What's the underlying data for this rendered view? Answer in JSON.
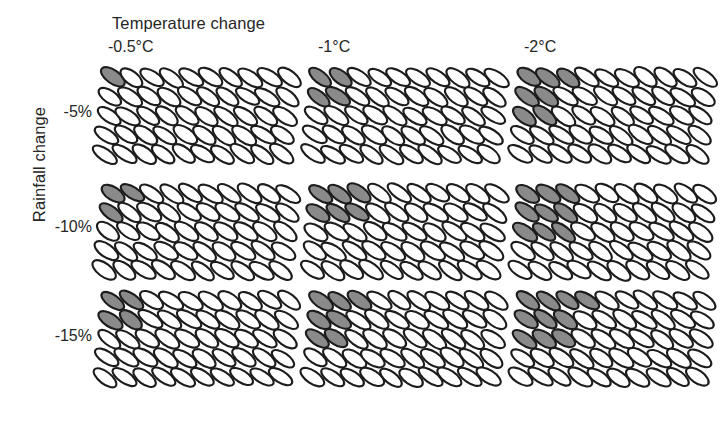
{
  "figure": {
    "x_axis_title": "Temperature change",
    "y_axis_title": "Rainfall change",
    "column_headers": [
      "-0.5°C",
      "-1°C",
      "-2°C"
    ],
    "row_labels": [
      "-5%",
      "-10%",
      "-15%"
    ]
  },
  "glyph": {
    "shape": "ellipse",
    "grid_columns": 10,
    "grid_rows": 5,
    "total_per_panel": 50,
    "tilt_degrees": -55,
    "filled_color": "#8a8a8a",
    "empty_color": "#ffffff",
    "outline_color": "#1c1c1c"
  },
  "chart_data": {
    "type": "heatmap",
    "title": "",
    "subtitle": "",
    "xlabel": "Temperature change",
    "ylabel": "Rainfall change",
    "x": [
      "-0.5°C",
      "-1°C",
      "-2°C"
    ],
    "y": [
      "-5%",
      "-10%",
      "-15%"
    ],
    "units": "count of shaded ellipses out of 50",
    "grid": false,
    "legend": "none",
    "annotations": [],
    "cells": [
      {
        "row": "-5%",
        "col": "-0.5°C",
        "filled": 1,
        "total": 50,
        "fill_pattern": [
          1,
          0,
          0,
          0,
          0
        ]
      },
      {
        "row": "-5%",
        "col": "-1°C",
        "filled": 4,
        "total": 50,
        "fill_pattern": [
          2,
          2,
          0,
          0,
          0
        ]
      },
      {
        "row": "-5%",
        "col": "-2°C",
        "filled": 7,
        "total": 50,
        "fill_pattern": [
          3,
          2,
          2,
          0,
          0
        ]
      },
      {
        "row": "-10%",
        "col": "-0.5°C",
        "filled": 3,
        "total": 50,
        "fill_pattern": [
          2,
          1,
          0,
          0,
          0
        ]
      },
      {
        "row": "-10%",
        "col": "-1°C",
        "filled": 6,
        "total": 50,
        "fill_pattern": [
          3,
          3,
          0,
          0,
          0
        ]
      },
      {
        "row": "-10%",
        "col": "-2°C",
        "filled": 9,
        "total": 50,
        "fill_pattern": [
          3,
          3,
          3,
          0,
          0
        ]
      },
      {
        "row": "-15%",
        "col": "-0.5°C",
        "filled": 4,
        "total": 50,
        "fill_pattern": [
          2,
          2,
          0,
          0,
          0
        ]
      },
      {
        "row": "-15%",
        "col": "-1°C",
        "filled": 7,
        "total": 50,
        "fill_pattern": [
          3,
          2,
          2,
          0,
          0
        ]
      },
      {
        "row": "-15%",
        "col": "-2°C",
        "filled": 10,
        "total": 50,
        "fill_pattern": [
          4,
          3,
          3,
          0,
          0
        ]
      }
    ],
    "values": [
      [
        1,
        4,
        7
      ],
      [
        3,
        6,
        9
      ],
      [
        4,
        7,
        10
      ]
    ]
  },
  "layout": {
    "panel_positions": [
      {
        "left": 97,
        "top": 62
      },
      {
        "left": 305,
        "top": 62
      },
      {
        "left": 513,
        "top": 62
      },
      {
        "left": 97,
        "top": 178
      },
      {
        "left": 305,
        "top": 178
      },
      {
        "left": 513,
        "top": 178
      },
      {
        "left": 97,
        "top": 285
      },
      {
        "left": 305,
        "top": 285
      },
      {
        "left": 513,
        "top": 285
      }
    ],
    "column_header_positions": [
      {
        "left": 108,
        "top": 38
      },
      {
        "left": 318,
        "top": 38
      },
      {
        "left": 524,
        "top": 38
      }
    ],
    "row_label_positions": [
      {
        "left": 24,
        "top": 103,
        "width": 68
      },
      {
        "left": 24,
        "top": 218,
        "width": 68
      },
      {
        "left": 24,
        "top": 327,
        "width": 68
      }
    ]
  }
}
